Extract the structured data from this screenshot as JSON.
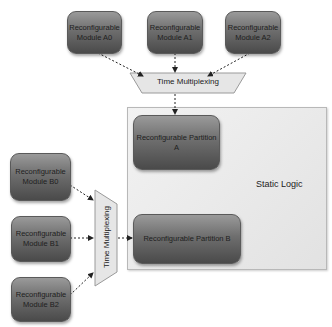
{
  "diagram": {
    "modules_a": [
      {
        "label": "Reconfigurable Module A0"
      },
      {
        "label": "Reconfigurable Module A1"
      },
      {
        "label": "Reconfigurable Module A2"
      }
    ],
    "modules_b": [
      {
        "label": "Reconfigurable Module B0"
      },
      {
        "label": "Reconfigurable Module B1"
      },
      {
        "label": "Reconfigurable Module B2"
      }
    ],
    "mux_top": {
      "label": "Time Multiplexing"
    },
    "mux_left": {
      "label": "Time Multiplexing"
    },
    "static_logic": {
      "label": "Static Logic"
    },
    "partition_a": {
      "label": "Reconfigurable Partition A"
    },
    "partition_b": {
      "label": "Reconfigurable Partition B"
    },
    "colors": {
      "module_fill_top": "#9a9a9a",
      "module_fill_bottom": "#4a4a4a",
      "static_fill": "#ececec",
      "mux_fill": "#e6e6e6"
    }
  }
}
